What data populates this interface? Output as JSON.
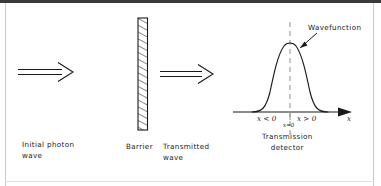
{
  "figure": {
    "type": "physics-schematic",
    "background_color": "#ffffff",
    "line_color": "#1a1a1a",
    "dashed_line_color": "#9a9a9a",
    "frame_color": "#3a3a3a"
  },
  "labels": {
    "initial_wave": "Initial photon\nwave",
    "barrier": "Barrier",
    "transmitted_wave": "Transmitted\nwave",
    "wavefunction": "Wavefunction",
    "x_negative": "x < 0",
    "x_positive": "x > 0",
    "x_zero": "x=0",
    "axis_x": "x",
    "detector": "Transmission\ndetector"
  },
  "elements": {
    "incident_arrow": {
      "name": "double-line-arrow",
      "direction": "right"
    },
    "barrier_block": {
      "name": "hatched-barrier",
      "hatch": "diagonal"
    },
    "transmitted_arrow": {
      "name": "double-line-arrow",
      "direction": "right"
    },
    "curve": {
      "name": "gaussian-wavefunction",
      "shape": "bell"
    },
    "center_line": {
      "name": "dashed-center-line",
      "style": "dashed"
    },
    "pointer": {
      "name": "annotation-arrow",
      "direction": "down-left"
    },
    "axis_arrowhead": {
      "name": "solid-arrowhead",
      "direction": "right"
    }
  }
}
